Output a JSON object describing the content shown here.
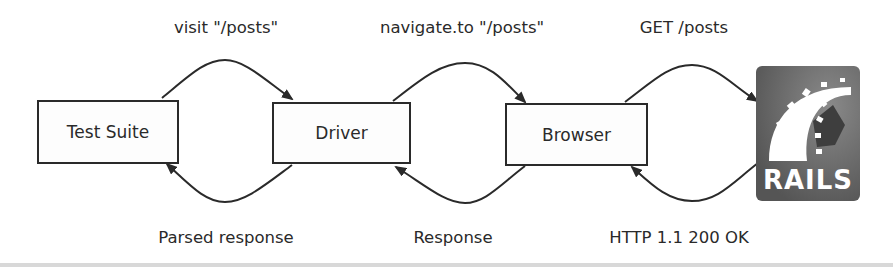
{
  "diagram": {
    "nodes": [
      {
        "id": "test-suite",
        "label": "Test Suite"
      },
      {
        "id": "driver",
        "label": "Driver"
      },
      {
        "id": "browser",
        "label": "Browser"
      },
      {
        "id": "rails",
        "label": "RAILS"
      }
    ],
    "edges": {
      "requests": [
        {
          "from": "test-suite",
          "to": "driver",
          "label": "visit \"/posts\""
        },
        {
          "from": "driver",
          "to": "browser",
          "label": "navigate.to \"/posts\""
        },
        {
          "from": "browser",
          "to": "rails",
          "label": "GET /posts"
        }
      ],
      "responses": [
        {
          "from": "driver",
          "to": "test-suite",
          "label": "Parsed response"
        },
        {
          "from": "browser",
          "to": "driver",
          "label": "Response"
        },
        {
          "from": "rails",
          "to": "browser",
          "label": "HTTP 1.1 200 OK"
        }
      ]
    },
    "colors": {
      "stroke": "#2a2a2a",
      "rails_bg": "#5e5e5e",
      "rails_fg": "#ffffff"
    }
  }
}
